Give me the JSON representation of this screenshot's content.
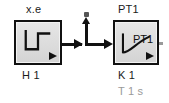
{
  "diagram": {
    "background_color": "#ffffff",
    "line_color": "#111111",
    "block_fill_color": "#d9d9d9",
    "gray_text_color": "#9a9a9a"
  },
  "blocks": [
    {
      "id": "source",
      "top_label": "x.e",
      "name_label": "H 1",
      "icon": "step-function-icon",
      "inner_text": ""
    },
    {
      "id": "pt1",
      "top_label": "PT1",
      "name_label": "K 1",
      "param_label": "T 1 s",
      "icon": "first-order-lag-icon",
      "inner_text": "PT1"
    }
  ],
  "wire": {
    "name": "signal-connection",
    "probe_label": ""
  }
}
